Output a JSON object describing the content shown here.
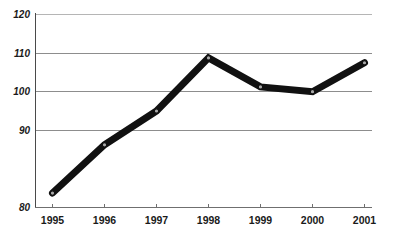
{
  "chart_data": {
    "type": "line",
    "title": "",
    "subtitle": "",
    "xlabel": "",
    "ylabel": "",
    "categories": [
      "1995",
      "1996",
      "1997",
      "1998",
      "1999",
      "2000",
      "2001"
    ],
    "x": [
      1995,
      1996,
      1997,
      1998,
      1999,
      2000,
      2001
    ],
    "values": [
      83,
      93,
      100,
      111,
      105,
      104,
      110
    ],
    "series": [
      {
        "name": "",
        "values": [
          83,
          93,
          100,
          111,
          105,
          104,
          110
        ]
      }
    ],
    "ylim": [
      80,
      120
    ],
    "yticks": [
      80,
      90,
      100,
      110,
      120
    ],
    "ytick_labels": [
      "80",
      "90",
      "100",
      "110",
      "120"
    ],
    "xtick_labels": [
      "1995",
      "1996",
      "1997",
      "1998",
      "1999",
      "2000",
      "2001"
    ],
    "grid": true,
    "grid_axis": "y",
    "legend": false,
    "legend_position": "none",
    "annotations": [],
    "colors": {
      "line": "#111111",
      "marker_fill": "#a9a9a9",
      "marker_edge": "#111111",
      "gridline": "#8d8d8d",
      "gridline_top": "#b5b5b5",
      "axis": "#6f6f6f",
      "text": "#1a1a1a",
      "background": "#ffffff"
    }
  },
  "axes": {
    "y": {
      "ticks": [
        {
          "label": "120",
          "value": 120
        },
        {
          "label": "110",
          "value": 110
        },
        {
          "label": "100",
          "value": 100
        },
        {
          "label": "90",
          "value": 90
        },
        {
          "label": "80",
          "value": 80
        }
      ]
    },
    "x": {
      "ticks": [
        {
          "label": "1995"
        },
        {
          "label": "1996"
        },
        {
          "label": "1997"
        },
        {
          "label": "1998"
        },
        {
          "label": "1999"
        },
        {
          "label": "2000"
        },
        {
          "label": "2001"
        }
      ]
    }
  }
}
